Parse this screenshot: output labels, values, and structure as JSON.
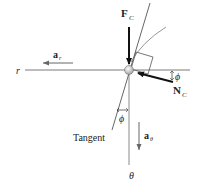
{
  "diagram": {
    "labels": {
      "r_axis": "r",
      "theta_axis": "θ",
      "a_r_main": "a",
      "a_r_sub": "r",
      "a_theta_main": "a",
      "a_theta_sub": "θ",
      "F_C_main": "F",
      "F_C_sub": "C",
      "N_C_main": "N",
      "N_C_sub": "C",
      "phi_right": "ϕ",
      "phi_bottom": "ϕ",
      "tangent": "Tangent"
    },
    "colors": {
      "axis": "#7a7a7a",
      "force": "#111111",
      "accel": "#666666",
      "curve": "#8a8a8a",
      "particle": "#cfcfcf"
    }
  }
}
